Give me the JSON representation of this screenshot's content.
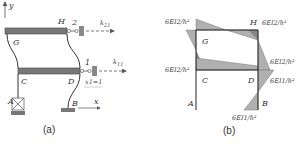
{
  "figure_a": {
    "caption": "(a)",
    "axis_y": "y",
    "axis_x": "x",
    "nodes": {
      "G": "G",
      "H": "H",
      "C": "C",
      "D": "D",
      "A": "A",
      "B": "B"
    },
    "constraint_2": "2",
    "constraint_1": "1",
    "force_upper": "k21",
    "force_lower": "k11",
    "displacement": "x1=1",
    "beam_color": "#777777"
  },
  "figure_b": {
    "caption": "(b)",
    "nodes": {
      "G": "G",
      "H": "H",
      "C": "C",
      "D": "D",
      "A": "A",
      "B": "B"
    },
    "moment_labels": {
      "g_top_left": "6EI2/h²",
      "h_top_right": "6EI2/h²",
      "c_left": "6EI2/h²",
      "d_right_upper": "6EI2/h²",
      "d_right_lower": "6EI1/h²",
      "b_bottom": "6EI1/h²"
    },
    "fill_color": "#b0b0b0",
    "dark_fill_color": "#888888"
  }
}
